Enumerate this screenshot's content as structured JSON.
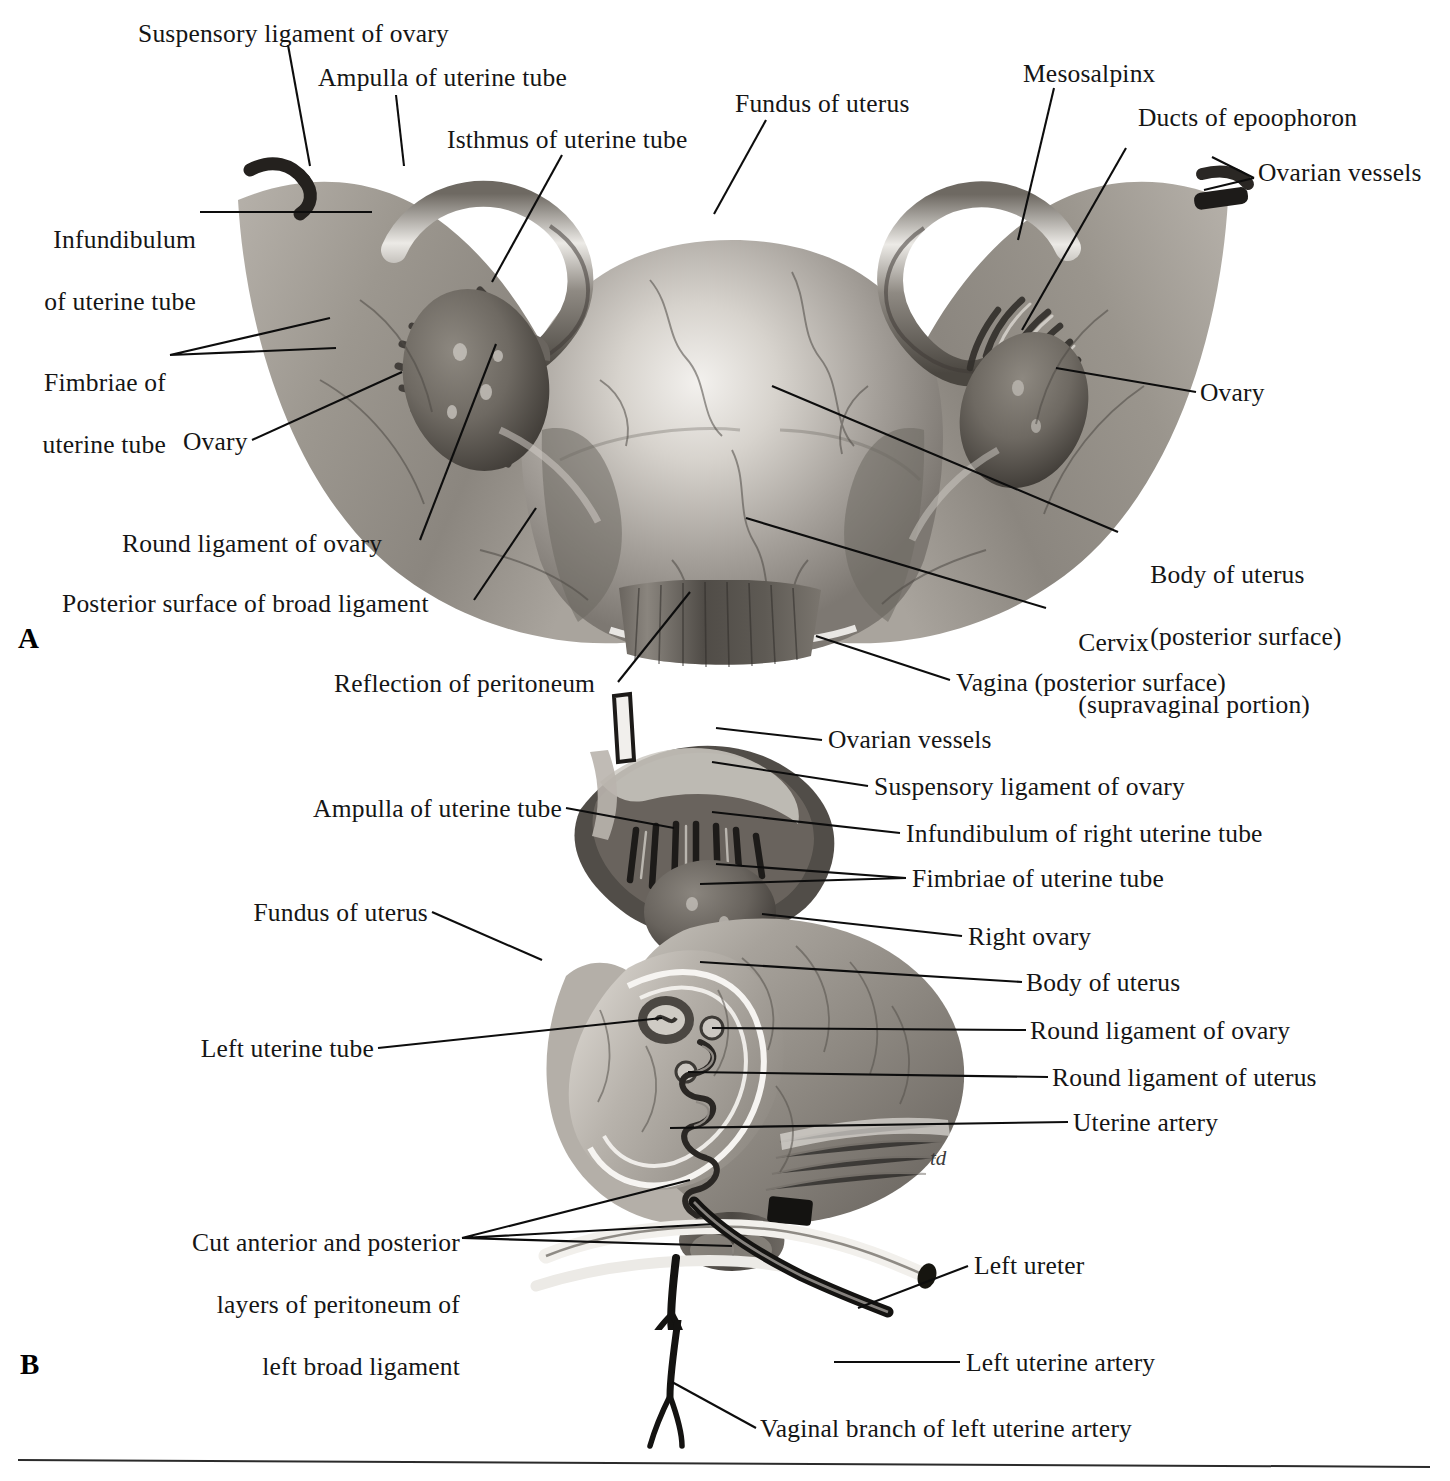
{
  "plate": {
    "figure_a_marker": "A",
    "figure_b_marker": "B",
    "artist_signature": "td"
  },
  "figure_a": {
    "marker": "A",
    "labels": [
      {
        "id": "suspensory-ligament-of-ovary",
        "text": "Suspensory ligament of ovary"
      },
      {
        "id": "ampulla-of-uterine-tube",
        "text": "Ampulla of uterine tube"
      },
      {
        "id": "isthmus-of-uterine-tube",
        "text": "Isthmus of uterine tube"
      },
      {
        "id": "fundus-of-uterus",
        "text": "Fundus of uterus"
      },
      {
        "id": "mesosalpinx",
        "text": "Mesosalpinx"
      },
      {
        "id": "ducts-of-epoophoron",
        "text": "Ducts of epoophoron"
      },
      {
        "id": "ovarian-vessels",
        "text": "Ovarian vessels"
      },
      {
        "id": "infundibulum-of-uterine-tube-l1",
        "text": "Infundibulum"
      },
      {
        "id": "infundibulum-of-uterine-tube-l2",
        "text": "of uterine tube"
      },
      {
        "id": "fimbriae-of-uterine-tube-l1",
        "text": "Fimbriae of"
      },
      {
        "id": "fimbriae-of-uterine-tube-l2",
        "text": "uterine tube"
      },
      {
        "id": "ovary-left",
        "text": "Ovary"
      },
      {
        "id": "ovary-right",
        "text": "Ovary"
      },
      {
        "id": "round-ligament-of-ovary",
        "text": "Round ligament of ovary"
      },
      {
        "id": "posterior-surface-of-broad-ligament",
        "text": "Posterior surface of broad ligament"
      },
      {
        "id": "body-of-uterus-l1",
        "text": "Body of uterus"
      },
      {
        "id": "body-of-uterus-l2",
        "text": "(posterior surface)"
      },
      {
        "id": "cervix-l1",
        "text": "Cervix"
      },
      {
        "id": "cervix-l2",
        "text": "(supravaginal portion)"
      },
      {
        "id": "reflection-of-peritoneum",
        "text": "Reflection of peritoneum"
      },
      {
        "id": "vagina-posterior-surface",
        "text": "Vagina (posterior surface)"
      }
    ]
  },
  "figure_b": {
    "marker": "B",
    "labels": [
      {
        "id": "ovarian-vessels",
        "text": "Ovarian vessels"
      },
      {
        "id": "suspensory-ligament-of-ovary",
        "text": "Suspensory ligament of ovary"
      },
      {
        "id": "infundibulum-of-right-uterine-tube",
        "text": "Infundibulum of right uterine tube"
      },
      {
        "id": "fimbriae-of-uterine-tube",
        "text": "Fimbriae of uterine tube"
      },
      {
        "id": "right-ovary",
        "text": "Right ovary"
      },
      {
        "id": "body-of-uterus",
        "text": "Body of uterus"
      },
      {
        "id": "round-ligament-of-ovary",
        "text": "Round ligament of ovary"
      },
      {
        "id": "round-ligament-of-uterus",
        "text": "Round ligament of uterus"
      },
      {
        "id": "uterine-artery",
        "text": "Uterine artery"
      },
      {
        "id": "ampulla-of-uterine-tube",
        "text": "Ampulla of uterine tube"
      },
      {
        "id": "fundus-of-uterus",
        "text": "Fundus of uterus"
      },
      {
        "id": "left-uterine-tube",
        "text": "Left uterine tube"
      },
      {
        "id": "cut-layers-l1",
        "text": "Cut anterior and posterior"
      },
      {
        "id": "cut-layers-l2",
        "text": "layers of peritoneum of"
      },
      {
        "id": "cut-layers-l3",
        "text": "left broad ligament"
      },
      {
        "id": "left-ureter",
        "text": "Left ureter"
      },
      {
        "id": "left-uterine-artery",
        "text": "Left uterine artery"
      },
      {
        "id": "vaginal-branch-of-left-uterine-artery",
        "text": "Vaginal branch of left uterine artery"
      }
    ]
  },
  "colors": {
    "ink": "#151515",
    "leader": "#0d0d0d",
    "page": "#ffffff",
    "rule": "#2b2b2b",
    "tissue_mid": "#9a9691",
    "tissue_light": "#d9d5cf",
    "tissue_dark": "#5d5953"
  }
}
